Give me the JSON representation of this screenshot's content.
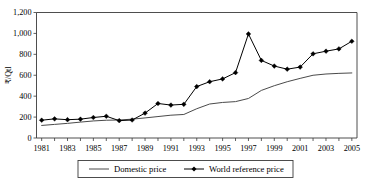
{
  "chart_data": {
    "type": "line",
    "title": "",
    "xlabel": "",
    "ylabel": "₹/Qtl",
    "x": [
      1981,
      1982,
      1983,
      1984,
      1985,
      1986,
      1987,
      1988,
      1989,
      1990,
      1991,
      1992,
      1993,
      1994,
      1995,
      1996,
      1997,
      1998,
      1999,
      2000,
      2001,
      2002,
      2003,
      2004,
      2005
    ],
    "xlim": [
      1980.6,
      2005.4
    ],
    "ylim": [
      0,
      1200
    ],
    "ytick_labels": [
      "0",
      "200",
      "400",
      "600",
      "800",
      "1,000",
      "1,200"
    ],
    "ytick_values": [
      0,
      200,
      400,
      600,
      800,
      1000,
      1200
    ],
    "xtick_labels": [
      "1981",
      "1983",
      "1985",
      "1987",
      "1989",
      "1991",
      "1993",
      "1995",
      "1997",
      "1999",
      "2001",
      "2003",
      "2005"
    ],
    "xtick_values": [
      1981,
      1983,
      1985,
      1987,
      1989,
      1991,
      1993,
      1995,
      1997,
      1999,
      2001,
      2003,
      2005
    ],
    "grid": false,
    "legend_position": "bottom",
    "series": [
      {
        "name": "Domestic price",
        "marker": "none",
        "color": "#4a4a4a",
        "values": [
          120,
          130,
          140,
          152,
          163,
          170,
          172,
          180,
          192,
          205,
          218,
          225,
          280,
          325,
          340,
          348,
          378,
          455,
          500,
          538,
          570,
          600,
          612,
          618,
          622
        ]
      },
      {
        "name": "World reference price",
        "marker": "diamond",
        "color": "#000000",
        "values": [
          170,
          183,
          175,
          180,
          196,
          208,
          166,
          172,
          238,
          330,
          315,
          322,
          492,
          538,
          565,
          625,
          995,
          742,
          688,
          658,
          678,
          805,
          830,
          852,
          925
        ]
      }
    ]
  },
  "legend": {
    "items": [
      {
        "label": "Domestic price",
        "marker": "line"
      },
      {
        "label": "World reference price",
        "marker": "line-diamond"
      }
    ]
  },
  "axis": {
    "y_title": "₹/Qtl"
  }
}
